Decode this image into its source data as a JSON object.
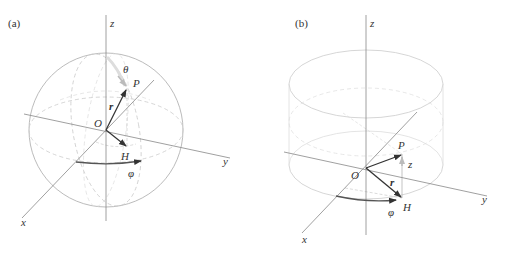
{
  "panels": [
    {
      "id": "a",
      "label": "(a)",
      "shape": "sphere",
      "axes": {
        "x": "x",
        "y": "y",
        "z": "z"
      },
      "points": {
        "origin": "O",
        "point": "P",
        "projection": "H"
      },
      "quantities": {
        "radius": "r",
        "polar_angle": "θ",
        "azimuth": "φ"
      }
    },
    {
      "id": "b",
      "label": "(b)",
      "shape": "cylinder",
      "axes": {
        "x": "x",
        "y": "y",
        "z": "z"
      },
      "points": {
        "origin": "O",
        "point": "P",
        "projection": "H"
      },
      "quantities": {
        "radius": "r",
        "height": "z",
        "azimuth": "φ"
      }
    }
  ],
  "colors": {
    "axis": "#888888",
    "wire": "#c8c8c8",
    "vector": "#333333",
    "arc": "#555555"
  }
}
